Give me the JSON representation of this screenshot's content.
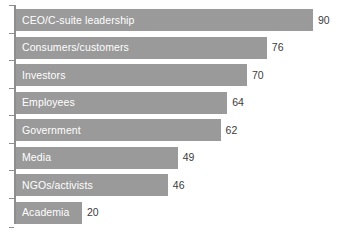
{
  "chart_data": {
    "type": "bar",
    "orientation": "horizontal",
    "title": "",
    "subtitle": "",
    "xlabel": "",
    "ylabel": "",
    "xlim": [
      0,
      90
    ],
    "grid": false,
    "legend": null,
    "categories": [
      "CEO/C-suite leadership",
      "Consumers/customers",
      "Investors",
      "Employees",
      "Government",
      "Media",
      "NGOs/activists",
      "Academia"
    ],
    "values": [
      90,
      76,
      70,
      64,
      62,
      49,
      46,
      20
    ],
    "bars": [
      {
        "label": "CEO/C-suite leadership",
        "value": 90,
        "value_text": "90"
      },
      {
        "label": "Consumers/customers",
        "value": 76,
        "value_text": "76"
      },
      {
        "label": "Investors",
        "value": 70,
        "value_text": "70"
      },
      {
        "label": "Employees",
        "value": 64,
        "value_text": "64"
      },
      {
        "label": "Government",
        "value": 62,
        "value_text": "62"
      },
      {
        "label": "Media",
        "value": 49,
        "value_text": "49"
      },
      {
        "label": "NGOs/activists",
        "value": 46,
        "value_text": "46"
      },
      {
        "label": "Academia",
        "value": 20,
        "value_text": "20"
      }
    ],
    "colors": {
      "bar_fill": "#9a9a9a",
      "bar_label_text": "#ffffff",
      "value_label_text": "#3b3b3b",
      "axis_line": "#8e8e8e",
      "background": "#ffffff"
    }
  }
}
